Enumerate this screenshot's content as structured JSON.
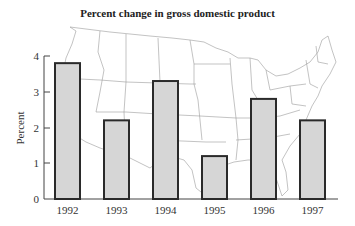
{
  "title": "Percent change in gross domestic product",
  "chart_data": {
    "type": "bar",
    "title": "Percent change in gross domestic product",
    "xlabel": "",
    "ylabel": "Percent",
    "categories": [
      "1992",
      "1993",
      "1994",
      "1995",
      "1996",
      "1997"
    ],
    "values": [
      3.8,
      2.2,
      3.3,
      1.2,
      2.8,
      2.2
    ],
    "ylim": [
      0,
      4
    ],
    "yticks": [
      0,
      1,
      2,
      3,
      4
    ],
    "grid": false,
    "legend": null,
    "background": "outline map of the contiguous United States",
    "colors": {
      "bar_fill": "#d6d6d6",
      "bar_edge": "#2a2a2a",
      "map_lines": "#9a9a9a"
    }
  }
}
